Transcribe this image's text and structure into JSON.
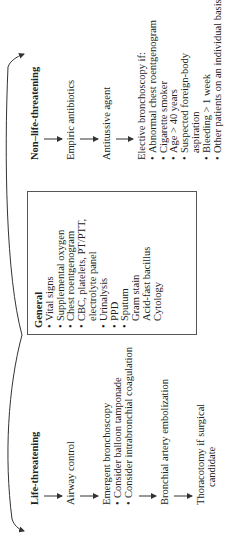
{
  "diagram": {
    "orientation": "rotated-90-ccw",
    "general_box": {
      "title": "General",
      "items": [
        {
          "text": "Vital signs",
          "bullet": true
        },
        {
          "text": "Supplemental oxygen",
          "bullet": true
        },
        {
          "text": "Chest roentgenogram",
          "bullet": true
        },
        {
          "text": "CBC, platelets, PT/PTT,",
          "bullet": true
        },
        {
          "text": "electrolyte panel",
          "bullet": false,
          "indent": true
        },
        {
          "text": "Urinalysis",
          "bullet": true
        },
        {
          "text": "PPD",
          "bullet": true
        },
        {
          "text": "Sputum",
          "bullet": true
        },
        {
          "text": "Gram stain",
          "bullet": false,
          "indent": true
        },
        {
          "text": "Acid-fast bacillus",
          "bullet": false,
          "indent": true
        },
        {
          "text": "Cytology",
          "bullet": false,
          "indent": true
        }
      ]
    },
    "life_threatening": {
      "title": "Life-threatening",
      "steps": [
        {
          "lines": [
            "Airway control"
          ]
        },
        {
          "lines": [
            "Emergent bronchoscopy"
          ],
          "bullets": [
            "Consider balloon tamponade",
            "Consider intrabronchial coagulation"
          ]
        },
        {
          "lines": [
            "Bronchial artery embolization"
          ]
        },
        {
          "lines": [
            "Thoracotomy if surgical",
            "candidate"
          ]
        }
      ]
    },
    "non_life_threatening": {
      "title": "Non–life-threatening",
      "steps": [
        {
          "lines": [
            "Empiric antibiotics"
          ]
        },
        {
          "lines": [
            "Antitussive agent"
          ]
        },
        {
          "lines": [
            "Elective bronchoscopy if:"
          ],
          "bullets": [
            "Abnormal chest roentgenogram",
            "Cigarette smoker",
            "Age > 40 years",
            "Suspected foreign-body",
            "Bleeding > 1 week",
            "Other patients on an individual basis"
          ],
          "continuation": "aspiration"
        }
      ]
    },
    "colors": {
      "line": "#333333",
      "text": "#222222",
      "box_border": "#555555"
    }
  }
}
